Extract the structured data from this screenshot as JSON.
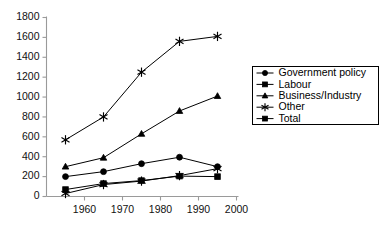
{
  "chart_data": {
    "type": "line",
    "title": "",
    "subtitle": "",
    "xlabel": "",
    "ylabel": "",
    "x": [
      1955,
      1965,
      1975,
      1985,
      1995
    ],
    "xlim": [
      1950,
      2000
    ],
    "ylim": [
      0,
      1800
    ],
    "xticks": [
      1960,
      1970,
      1980,
      1990,
      2000
    ],
    "yticks": [
      0,
      200,
      400,
      600,
      800,
      1000,
      1200,
      1400,
      1600,
      1800
    ],
    "grid": false,
    "legend_position": "right",
    "series": [
      {
        "name": "Government policy",
        "marker": "circle",
        "values": [
          200,
          250,
          330,
          395,
          300
        ]
      },
      {
        "name": "Labour",
        "marker": "square",
        "values": [
          70,
          130,
          160,
          205,
          200
        ]
      },
      {
        "name": "Business/Industry",
        "marker": "triangle",
        "values": [
          300,
          390,
          630,
          860,
          1010
        ]
      },
      {
        "name": "Other",
        "marker": "star",
        "values": [
          30,
          120,
          155,
          210,
          280
        ]
      },
      {
        "name": "Total",
        "marker": "star",
        "values": [
          570,
          800,
          1250,
          1560,
          1610
        ]
      }
    ]
  },
  "legend": {
    "entries": [
      {
        "label": "Government policy",
        "marker": "circle"
      },
      {
        "label": "Labour",
        "marker": "square"
      },
      {
        "label": "Business/Industry",
        "marker": "triangle"
      },
      {
        "label": "Other",
        "marker": "star"
      },
      {
        "label": "Total",
        "marker": "square"
      }
    ]
  },
  "colors": {
    "series": "#000000",
    "axis": "#9a9a9a",
    "text": "#111111",
    "background": "#ffffff"
  }
}
